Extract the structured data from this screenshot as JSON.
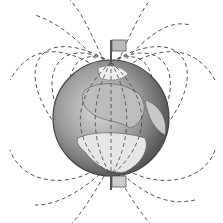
{
  "scene": {
    "subject": "Earth magnetic field illustration",
    "description": "Globe with dashed magnetic field lines looping from pole to pole, flags marking north and south poles",
    "colors": {
      "background": "#ffffff",
      "globe_dark": "#555555",
      "globe_light": "#d8d8d8",
      "land": "#e6e6e6",
      "field_lines": "#555555",
      "flag": "#bbbbbb",
      "pole": "#555555"
    }
  }
}
